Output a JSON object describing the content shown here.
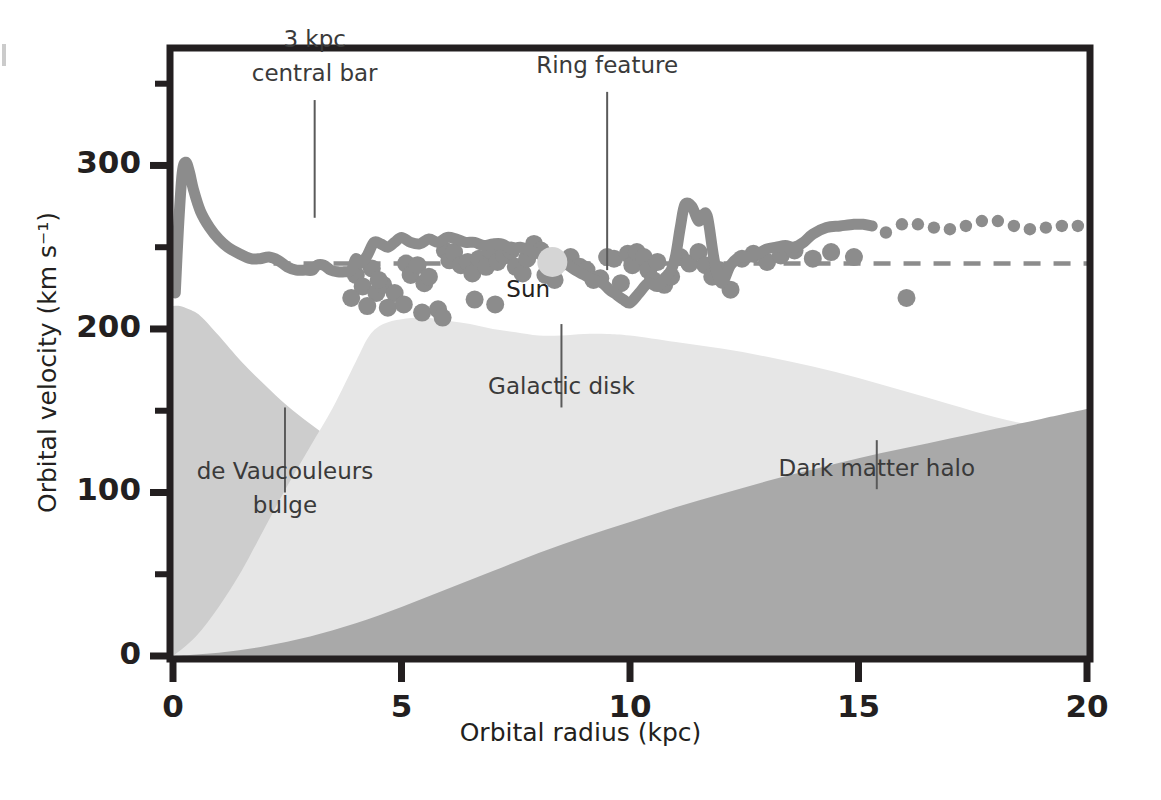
{
  "chart_data": {
    "type": "area",
    "title": "",
    "xlabel": "Orbital radius (kpc)",
    "ylabel": "Orbital velocity (km s⁻¹)",
    "xlim": [
      0,
      20
    ],
    "ylim": [
      0,
      370
    ],
    "xticks": [
      0,
      5,
      10,
      15,
      20
    ],
    "xtick_labels": [
      "0",
      "5",
      "10",
      "15",
      "20"
    ],
    "xminor": [
      2.5,
      7.5,
      12.5,
      17.5
    ],
    "yticks": [
      0,
      100,
      200,
      300
    ],
    "ytick_labels": [
      "0",
      "100",
      "200",
      "300"
    ],
    "yminor": [
      50,
      150,
      250,
      350
    ],
    "grid": false,
    "legend_position": "none",
    "colors": {
      "bulge": "#cdcdcd",
      "disk": "#e6e6e6",
      "halo": "#a9a9a9",
      "curve": "#8c8c8c",
      "points": "#8c8c8c",
      "sun": "#d5d5d5",
      "axis": "#231f20",
      "reference_line": "#8c8c8c",
      "leader_line": "#5a5a5a"
    },
    "reference_line": {
      "y": 240,
      "style": "dashed"
    },
    "series": [
      {
        "name": "de Vaucouleurs bulge",
        "kind": "area",
        "color": "#cdcdcd",
        "x": [
          0,
          0.15,
          0.35,
          0.6,
          1.0,
          1.5,
          2.0,
          2.5,
          3.0,
          3.5,
          4.0,
          4.5,
          5.0,
          5.5,
          6.0,
          7.0,
          8.0,
          9.0,
          10.0,
          11.0,
          12.0,
          13.0,
          14.0,
          15.0,
          16.0,
          17.0,
          18.0,
          19.0,
          20.0
        ],
        "y": [
          214,
          214,
          212,
          208,
          196,
          180,
          166,
          153,
          142,
          132,
          124,
          116,
          110,
          104,
          99,
          90,
          83,
          77,
          72,
          68,
          64,
          61,
          58,
          55,
          52,
          50,
          47,
          45,
          43
        ]
      },
      {
        "name": "Galactic disk",
        "kind": "area",
        "color": "#e6e6e6",
        "x": [
          0,
          0.5,
          1.0,
          1.5,
          2.0,
          2.5,
          3.0,
          3.5,
          4.0,
          4.3,
          4.6,
          5.0,
          5.5,
          6.0,
          6.5,
          7.0,
          7.5,
          8.0,
          8.5,
          9.0,
          9.5,
          10.0,
          11.0,
          12.0,
          13.0,
          14.0,
          15.0,
          16.0,
          17.0,
          18.0,
          19.0,
          20.0
        ],
        "y": [
          0,
          12,
          30,
          52,
          78,
          104,
          128,
          152,
          180,
          196,
          203,
          206,
          207,
          205,
          203,
          200,
          198,
          196,
          196,
          197,
          197,
          196,
          192,
          188,
          183,
          177,
          170,
          162,
          154,
          146,
          140,
          136
        ]
      },
      {
        "name": "Dark matter halo",
        "kind": "area",
        "color": "#a9a9a9",
        "x": [
          0,
          1.0,
          2.0,
          3.0,
          4.0,
          5.0,
          6.0,
          7.0,
          8.0,
          9.0,
          10.0,
          11.0,
          12.0,
          13.0,
          14.0,
          15.0,
          16.0,
          17.0,
          18.0,
          19.0,
          20.0
        ],
        "y": [
          0,
          2,
          6,
          12,
          20,
          30,
          41,
          52,
          63,
          73,
          82,
          91,
          99,
          107,
          114,
          121,
          127,
          133,
          139,
          145,
          151
        ]
      },
      {
        "name": "Observed rotation curve",
        "kind": "line",
        "color": "#8c8c8c",
        "style": "solid",
        "x": [
          0.05,
          0.12,
          0.2,
          0.28,
          0.36,
          0.45,
          0.6,
          0.8,
          1.0,
          1.2,
          1.45,
          1.7,
          1.9,
          2.1,
          2.3,
          2.5,
          2.7,
          2.9,
          3.05,
          3.15,
          3.3,
          3.45,
          3.6,
          3.75,
          3.9,
          4.0,
          4.1,
          4.25,
          4.4,
          4.55,
          4.7,
          4.85,
          5.0,
          5.2,
          5.4,
          5.6,
          5.8,
          6.0,
          6.2,
          6.4,
          6.6,
          6.8,
          7.0,
          7.2,
          7.4,
          7.6,
          7.8,
          8.0,
          8.2,
          8.4,
          8.6,
          8.8,
          9.0,
          9.2,
          9.4,
          9.55,
          9.7,
          9.85,
          10.0,
          10.2,
          10.4,
          10.6,
          10.75,
          10.9,
          11.0,
          11.1,
          11.2,
          11.35,
          11.5,
          11.6,
          11.7,
          11.85,
          12.0,
          12.2,
          12.4,
          12.6,
          12.8,
          13.0,
          13.2,
          13.4,
          13.6,
          13.8,
          14.0,
          14.3,
          14.6,
          14.9,
          15.1,
          15.3
        ],
        "y": [
          222,
          262,
          295,
          302,
          296,
          285,
          272,
          262,
          255,
          250,
          246,
          243,
          243,
          244,
          242,
          238,
          236,
          236,
          236,
          239,
          239,
          236,
          235,
          235,
          236,
          243,
          240,
          245,
          253,
          252,
          250,
          253,
          256,
          253,
          252,
          255,
          253,
          256,
          255,
          253,
          253,
          251,
          252,
          252,
          249,
          250,
          248,
          246,
          244,
          243,
          240,
          236,
          233,
          230,
          228,
          224,
          221,
          218,
          216,
          222,
          228,
          226,
          231,
          236,
          245,
          262,
          276,
          275,
          266,
          270,
          268,
          241,
          228,
          239,
          244,
          244,
          246,
          249,
          250,
          251,
          250,
          253,
          258,
          262,
          263,
          264,
          264,
          263
        ]
      },
      {
        "name": "Extrapolated rotation curve",
        "kind": "line",
        "color": "#8c8c8c",
        "style": "dotted",
        "x": [
          15.6,
          15.95,
          16.3,
          16.65,
          17.0,
          17.35,
          17.7,
          18.05,
          18.4,
          18.75,
          19.1,
          19.45,
          19.8
        ],
        "y": [
          259,
          264,
          264,
          262,
          261,
          263,
          266,
          266,
          263,
          261,
          262,
          263,
          263
        ]
      }
    ],
    "scatter": {
      "name": "Measured tracer velocities",
      "color": "#8c8c8c",
      "radius_px": 9,
      "points": [
        [
          4.0,
          233
        ],
        [
          4.15,
          226
        ],
        [
          4.35,
          237
        ],
        [
          4.45,
          222
        ],
        [
          4.6,
          227
        ],
        [
          4.85,
          222
        ],
        [
          5.1,
          240
        ],
        [
          5.2,
          233
        ],
        [
          5.35,
          239
        ],
        [
          5.5,
          228
        ],
        [
          5.6,
          232
        ],
        [
          5.8,
          212
        ],
        [
          5.95,
          248
        ],
        [
          6.05,
          242
        ],
        [
          6.15,
          247
        ],
        [
          6.3,
          239
        ],
        [
          6.45,
          241
        ],
        [
          6.55,
          234
        ],
        [
          6.7,
          243
        ],
        [
          6.85,
          238
        ],
        [
          6.95,
          248
        ],
        [
          7.1,
          241
        ],
        [
          7.25,
          245
        ],
        [
          7.4,
          248
        ],
        [
          7.5,
          238
        ],
        [
          7.65,
          234
        ],
        [
          7.75,
          243
        ],
        [
          7.9,
          252
        ],
        [
          8.05,
          248
        ],
        [
          8.2,
          244
        ],
        [
          8.35,
          230
        ],
        [
          8.5,
          241
        ],
        [
          8.7,
          244
        ],
        [
          8.9,
          238
        ],
        [
          9.05,
          236
        ],
        [
          9.2,
          230
        ],
        [
          9.35,
          231
        ],
        [
          9.5,
          244
        ],
        [
          9.65,
          243
        ],
        [
          9.8,
          228
        ],
        [
          9.95,
          246
        ],
        [
          10.05,
          239
        ],
        [
          10.15,
          247
        ],
        [
          10.3,
          244
        ],
        [
          10.4,
          236
        ],
        [
          10.5,
          230
        ],
        [
          10.6,
          241
        ],
        [
          10.75,
          227
        ],
        [
          10.9,
          232
        ],
        [
          11.1,
          244
        ],
        [
          11.3,
          240
        ],
        [
          11.5,
          247
        ],
        [
          11.65,
          239
        ],
        [
          11.8,
          232
        ],
        [
          11.95,
          236
        ],
        [
          12.2,
          224
        ],
        [
          12.45,
          243
        ],
        [
          12.7,
          246
        ],
        [
          13.0,
          241
        ],
        [
          13.3,
          245
        ],
        [
          13.6,
          248
        ],
        [
          14.0,
          243
        ],
        [
          14.4,
          247
        ],
        [
          14.9,
          244
        ],
        [
          16.05,
          219
        ],
        [
          4.25,
          214
        ],
        [
          4.7,
          213
        ],
        [
          5.05,
          215
        ],
        [
          5.45,
          210
        ],
        [
          5.9,
          207
        ],
        [
          6.6,
          218
        ],
        [
          7.05,
          215
        ],
        [
          3.9,
          219
        ],
        [
          4.5,
          230
        ],
        [
          8.15,
          233
        ]
      ],
      "highlight": {
        "label": "Sun",
        "x": 8.3,
        "y": 241,
        "color": "#d5d5d5",
        "radius_px": 15
      }
    },
    "annotations": [
      {
        "id": "central-bar",
        "lines": [
          "3 kpc",
          "central bar"
        ],
        "target_x": 3.1,
        "target_y": 268,
        "label_x": 3.1,
        "label_y": 340
      },
      {
        "id": "ring-feature",
        "lines": [
          "Ring feature"
        ],
        "target_x": 9.5,
        "target_y": 236,
        "label_x": 9.5,
        "label_y": 345
      },
      {
        "id": "galactic-disk",
        "lines": [
          "Galactic disk"
        ],
        "target_x": 8.5,
        "target_y": 203,
        "label_x": 8.5,
        "label_y": 152
      },
      {
        "id": "de-vaucouleurs-bulge",
        "lines": [
          "de Vaucouleurs",
          "bulge"
        ],
        "target_x": 2.45,
        "target_y": 152,
        "label_x": 2.45,
        "label_y": 100
      },
      {
        "id": "dark-matter-halo",
        "lines": [
          "Dark matter halo"
        ],
        "target_x": 15.4,
        "target_y": 132,
        "label_x": 15.4,
        "label_y": 102
      }
    ]
  }
}
